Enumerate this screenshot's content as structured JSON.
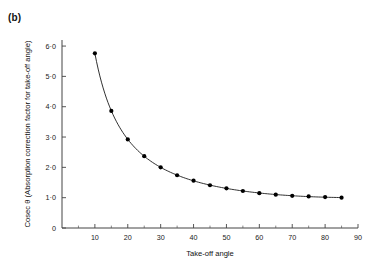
{
  "figure": {
    "panel_label": "(b)",
    "background": "#ffffff",
    "ink": "#1a1a1a"
  },
  "chart_data": {
    "type": "line",
    "title": "",
    "subtitle": "",
    "xlabel": "Take-off angle",
    "ylabel": "Cosec θ (Absorption correction factor for take-off angle)",
    "xlim": [
      0,
      90
    ],
    "ylim": [
      0,
      6.2
    ],
    "grid": false,
    "legend": null,
    "x_ticks": [
      0,
      10,
      20,
      30,
      40,
      50,
      60,
      70,
      80,
      90
    ],
    "x_tick_labels": [
      "",
      "10",
      "20",
      "30",
      "40",
      "50",
      "60",
      "70",
      "80",
      "90"
    ],
    "x_minor_ticks": [
      5,
      15,
      25,
      35,
      45,
      55,
      65,
      75,
      85
    ],
    "y_ticks": [
      0,
      1.0,
      2.0,
      3.0,
      4.0,
      5.0,
      6.0
    ],
    "y_tick_labels": [
      "0",
      "1·0",
      "2·0",
      "3·0",
      "4·0",
      "5·0",
      "6·0"
    ],
    "marker": "filled-circle",
    "marker_size": 2.1,
    "series": [
      {
        "name": "cosec θ",
        "x": [
          10,
          15,
          20,
          25,
          30,
          35,
          40,
          45,
          50,
          55,
          60,
          65,
          70,
          75,
          80,
          85
        ],
        "y": [
          5.76,
          3.86,
          2.92,
          2.37,
          2.0,
          1.74,
          1.56,
          1.41,
          1.31,
          1.22,
          1.15,
          1.1,
          1.06,
          1.04,
          1.02,
          1.0
        ]
      }
    ]
  }
}
